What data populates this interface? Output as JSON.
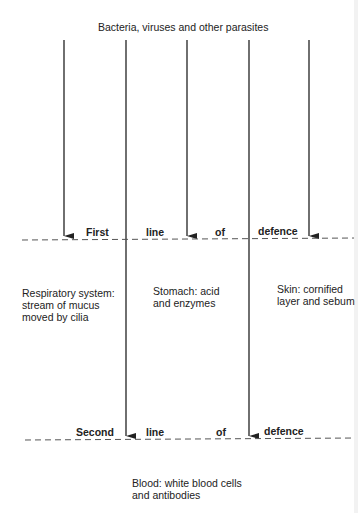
{
  "title": "Bacteria, viruses and other parasites",
  "first_line": {
    "words": [
      "First",
      "line",
      "of",
      "defence"
    ]
  },
  "second_line": {
    "words": [
      "Second",
      "line",
      "of",
      "defence"
    ]
  },
  "barriers": [
    {
      "line1": "Respiratory system:",
      "line2": "stream of mucus",
      "line3": "moved by cilia"
    },
    {
      "line1": "Stomach: acid",
      "line2": "and enzymes"
    },
    {
      "line1": "Skin: cornified",
      "line2": "layer and sebum"
    }
  ],
  "blood": {
    "line1": "Blood: white blood cells",
    "line2": "and antibodies"
  },
  "colors": {
    "ink": "#222222",
    "dash": "#555555",
    "background": "#ffffff"
  }
}
